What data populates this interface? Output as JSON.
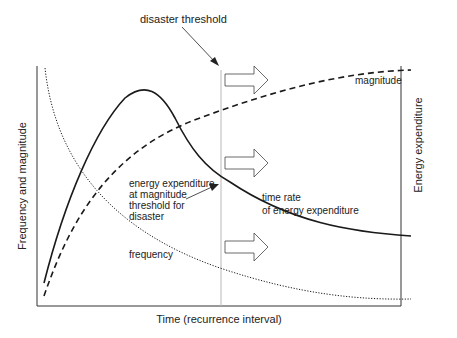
{
  "title": "",
  "colors": {
    "ink": "#1a1a1a",
    "axis": "#333333",
    "threshold_line": "#b8b8b8",
    "arrow_stroke": "#444444",
    "arrow_fill": "#ffffff"
  },
  "axes": {
    "x_label": "Time (recurrence interval)",
    "y_left_label": "Frequency and magnitude",
    "y_right_label": "Energy expenditure"
  },
  "annotations": {
    "disaster_threshold": "disaster threshold",
    "magnitude": "magnitude",
    "frequency": "frequency",
    "time_rate_line1": "time rate",
    "time_rate_line2": "of energy expenditure",
    "energy_line1": "energy expenditure",
    "energy_line2": "at magnitude",
    "energy_line3": "threshold for",
    "energy_line4": "disaster"
  },
  "chart_data": {
    "type": "line",
    "title": "",
    "xlabel": "Time (recurrence interval)",
    "ylabel": "Frequency and magnitude",
    "ylabel_right": "Energy expenditure",
    "grid": false,
    "legend": "none (curves labelled inline)",
    "threshold": {
      "label": "disaster threshold",
      "x_fraction": 0.5
    },
    "series": [
      {
        "name": "magnitude",
        "style": "dashed",
        "description": "rises steeply then levels off toward maximum"
      },
      {
        "name": "frequency",
        "style": "dotted",
        "description": "starts high and decays toward zero"
      },
      {
        "name": "time rate of energy expenditure",
        "style": "solid",
        "description": "rises to a peak early then decays"
      }
    ],
    "paths": {
      "magnitude": "M 44 296 C 70 220, 110 150, 200 118 C 270 92, 340 72, 411 70",
      "frequency": "M 45 68 C 55 160, 110 230, 220 268 C 300 295, 360 300, 411 299",
      "energy": "M 44 283 C 65 200, 95 130, 125 98 C 145 82, 160 90, 175 118 C 190 148, 205 168, 230 182 C 290 222, 350 232, 411 236"
    },
    "arrows_y": [
      79,
      162,
      247
    ]
  }
}
